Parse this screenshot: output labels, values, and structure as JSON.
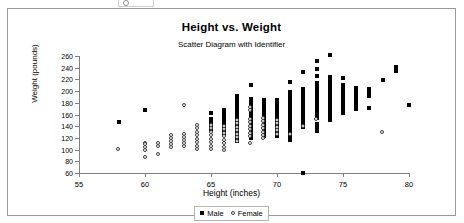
{
  "chart_data": {
    "type": "scatter",
    "title": "Height vs. Weight",
    "subtitle": "Scatter Diagram with Identifier",
    "xlabel": "Height (inches)",
    "ylabel": "Weight (pounds)",
    "xlim": [
      55,
      80
    ],
    "ylim": [
      60,
      260
    ],
    "xticks": [
      55,
      60,
      65,
      70,
      75,
      80
    ],
    "yticks": [
      60,
      80,
      100,
      120,
      140,
      160,
      180,
      200,
      220,
      240,
      260
    ],
    "grid": false,
    "legend_position": "bottom",
    "series": [
      {
        "name": "Male",
        "marker": "filled-square",
        "color": "#000000",
        "points": [
          [
            58,
            147
          ],
          [
            60,
            168
          ],
          [
            65,
            162
          ],
          [
            65,
            152
          ],
          [
            65,
            146
          ],
          [
            65,
            140
          ],
          [
            65,
            134
          ],
          [
            66,
            168
          ],
          [
            66,
            162
          ],
          [
            66,
            156
          ],
          [
            66,
            150
          ],
          [
            66,
            144
          ],
          [
            66,
            138
          ],
          [
            66,
            132
          ],
          [
            66,
            126
          ],
          [
            67,
            192
          ],
          [
            67,
            186
          ],
          [
            67,
            180
          ],
          [
            67,
            174
          ],
          [
            67,
            168
          ],
          [
            67,
            162
          ],
          [
            67,
            156
          ],
          [
            67,
            150
          ],
          [
            67,
            144
          ],
          [
            67,
            138
          ],
          [
            67,
            132
          ],
          [
            67,
            126
          ],
          [
            67,
            120
          ],
          [
            67,
            114
          ],
          [
            68,
            210
          ],
          [
            68,
            186
          ],
          [
            68,
            180
          ],
          [
            68,
            174
          ],
          [
            68,
            168
          ],
          [
            68,
            162
          ],
          [
            68,
            156
          ],
          [
            68,
            150
          ],
          [
            68,
            144
          ],
          [
            68,
            138
          ],
          [
            68,
            132
          ],
          [
            68,
            126
          ],
          [
            68,
            120
          ],
          [
            69,
            184
          ],
          [
            69,
            178
          ],
          [
            69,
            172
          ],
          [
            69,
            166
          ],
          [
            69,
            160
          ],
          [
            69,
            154
          ],
          [
            69,
            148
          ],
          [
            69,
            142
          ],
          [
            69,
            136
          ],
          [
            69,
            130
          ],
          [
            69,
            124
          ],
          [
            70,
            184
          ],
          [
            70,
            178
          ],
          [
            70,
            172
          ],
          [
            70,
            166
          ],
          [
            70,
            160
          ],
          [
            70,
            154
          ],
          [
            70,
            148
          ],
          [
            70,
            142
          ],
          [
            70,
            136
          ],
          [
            70,
            130
          ],
          [
            70,
            124
          ],
          [
            71,
            216
          ],
          [
            71,
            198
          ],
          [
            71,
            192
          ],
          [
            71,
            186
          ],
          [
            71,
            180
          ],
          [
            71,
            174
          ],
          [
            71,
            168
          ],
          [
            71,
            162
          ],
          [
            71,
            156
          ],
          [
            71,
            150
          ],
          [
            71,
            144
          ],
          [
            71,
            138
          ],
          [
            71,
            132
          ],
          [
            71,
            126
          ],
          [
            71,
            120
          ],
          [
            71,
            116
          ],
          [
            72,
            232
          ],
          [
            72,
            204
          ],
          [
            72,
            198
          ],
          [
            72,
            192
          ],
          [
            72,
            186
          ],
          [
            72,
            180
          ],
          [
            72,
            174
          ],
          [
            72,
            168
          ],
          [
            72,
            162
          ],
          [
            72,
            156
          ],
          [
            72,
            150
          ],
          [
            72,
            144
          ],
          [
            72,
            138
          ],
          [
            72,
            60
          ],
          [
            73,
            252
          ],
          [
            73,
            238
          ],
          [
            73,
            226
          ],
          [
            73,
            214
          ],
          [
            73,
            208
          ],
          [
            73,
            202
          ],
          [
            73,
            196
          ],
          [
            73,
            190
          ],
          [
            73,
            184
          ],
          [
            73,
            178
          ],
          [
            73,
            172
          ],
          [
            73,
            166
          ],
          [
            73,
            160
          ],
          [
            73,
            154
          ],
          [
            73,
            144
          ],
          [
            73,
            138
          ],
          [
            73,
            132
          ],
          [
            74,
            261
          ],
          [
            74,
            224
          ],
          [
            74,
            218
          ],
          [
            74,
            212
          ],
          [
            74,
            206
          ],
          [
            74,
            200
          ],
          [
            74,
            194
          ],
          [
            74,
            188
          ],
          [
            74,
            182
          ],
          [
            74,
            176
          ],
          [
            74,
            170
          ],
          [
            74,
            164
          ],
          [
            74,
            158
          ],
          [
            74,
            151
          ],
          [
            75,
            222
          ],
          [
            75,
            210
          ],
          [
            75,
            204
          ],
          [
            75,
            198
          ],
          [
            75,
            192
          ],
          [
            75,
            186
          ],
          [
            75,
            180
          ],
          [
            75,
            174
          ],
          [
            75,
            168
          ],
          [
            75,
            163
          ],
          [
            76,
            205
          ],
          [
            76,
            199
          ],
          [
            76,
            193
          ],
          [
            76,
            187
          ],
          [
            76,
            181
          ],
          [
            76,
            175
          ],
          [
            76,
            170
          ],
          [
            77,
            203
          ],
          [
            77,
            197
          ],
          [
            77,
            191
          ],
          [
            77,
            171
          ],
          [
            78,
            219
          ],
          [
            79,
            241
          ],
          [
            79,
            235
          ],
          [
            80,
            176
          ]
        ]
      },
      {
        "name": "Female",
        "marker": "open-circle",
        "color": "#3a3a3a",
        "points": [
          [
            58,
            100
          ],
          [
            60,
            111
          ],
          [
            60,
            108
          ],
          [
            60,
            104
          ],
          [
            60,
            99
          ],
          [
            60,
            86
          ],
          [
            61,
            110
          ],
          [
            61,
            106
          ],
          [
            61,
            92
          ],
          [
            62,
            124
          ],
          [
            62,
            119
          ],
          [
            62,
            114
          ],
          [
            62,
            109
          ],
          [
            62,
            104
          ],
          [
            63,
            176
          ],
          [
            63,
            126
          ],
          [
            63,
            121
          ],
          [
            63,
            116
          ],
          [
            63,
            111
          ],
          [
            63,
            106
          ],
          [
            64,
            142
          ],
          [
            64,
            136
          ],
          [
            64,
            130
          ],
          [
            64,
            124
          ],
          [
            64,
            118
          ],
          [
            64,
            112
          ],
          [
            64,
            106
          ],
          [
            64,
            100
          ],
          [
            65,
            142
          ],
          [
            65,
            136
          ],
          [
            65,
            130
          ],
          [
            65,
            124
          ],
          [
            65,
            118
          ],
          [
            65,
            112
          ],
          [
            65,
            106
          ],
          [
            65,
            100
          ],
          [
            66,
            140
          ],
          [
            66,
            134
          ],
          [
            66,
            128
          ],
          [
            66,
            122
          ],
          [
            66,
            116
          ],
          [
            66,
            110
          ],
          [
            66,
            104
          ],
          [
            66,
            99
          ],
          [
            67,
            150
          ],
          [
            67,
            144
          ],
          [
            67,
            138
          ],
          [
            67,
            132
          ],
          [
            67,
            126
          ],
          [
            67,
            120
          ],
          [
            67,
            114
          ],
          [
            68,
            172
          ],
          [
            68,
            166
          ],
          [
            68,
            152
          ],
          [
            68,
            146
          ],
          [
            68,
            140
          ],
          [
            68,
            134
          ],
          [
            68,
            128
          ],
          [
            68,
            122
          ],
          [
            68,
            110
          ],
          [
            69,
            154
          ],
          [
            69,
            148
          ],
          [
            69,
            142
          ],
          [
            69,
            136
          ],
          [
            69,
            130
          ],
          [
            69,
            124
          ],
          [
            69,
            119
          ],
          [
            70,
            150
          ],
          [
            70,
            144
          ],
          [
            70,
            138
          ],
          [
            70,
            132
          ],
          [
            70,
            126
          ],
          [
            71,
            126
          ],
          [
            72,
            140
          ],
          [
            73,
            152
          ],
          [
            78,
            130
          ]
        ]
      }
    ]
  },
  "legend": {
    "male_label": "Male",
    "female_label": "Female"
  }
}
